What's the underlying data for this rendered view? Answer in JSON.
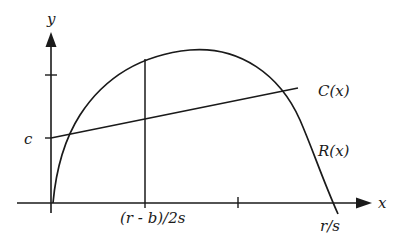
{
  "diagram": {
    "axes": {
      "x_label": "x",
      "y_label": "y"
    },
    "curves": {
      "revenue_label": "R(x)",
      "cost_label": "C(x)"
    },
    "annotations": {
      "intercept_label": "c",
      "vertex_x_label": "(r - b)/2s",
      "root_label": "r/s"
    },
    "colors": {
      "ink": "#1a1a1a",
      "background": "#ffffff"
    }
  }
}
